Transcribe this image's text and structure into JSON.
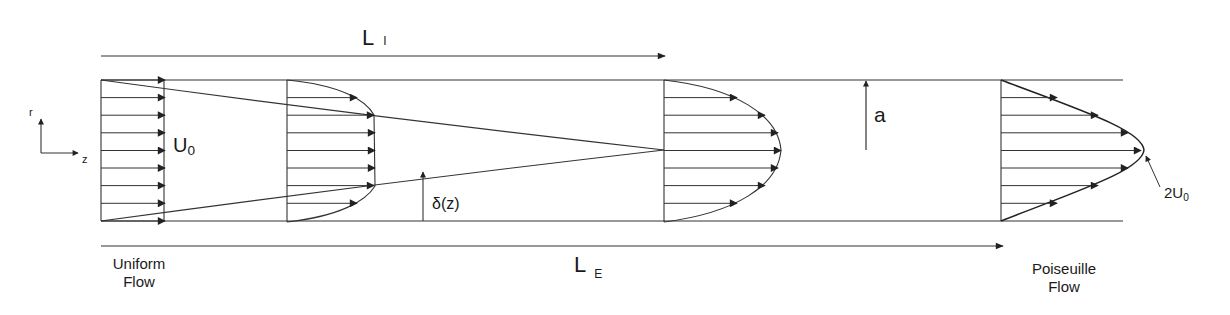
{
  "diagram": {
    "colors": {
      "line": "#333333",
      "text": "#1a1a1a",
      "background": "#ffffff"
    },
    "axes": {
      "r_label": "r",
      "z_label": "z"
    },
    "dimensions": {
      "inlet_length": {
        "symbol": "L",
        "subscript": "I"
      },
      "entrance_length": {
        "symbol": "L",
        "subscript": "E"
      },
      "radius": {
        "symbol": "a"
      },
      "boundary_layer": {
        "symbol": "δ(z)"
      }
    },
    "velocity_labels": {
      "uniform_velocity": {
        "symbol": "U",
        "subscript": "0"
      },
      "max_velocity": {
        "prefix": "2U",
        "subscript": "0"
      }
    },
    "captions": {
      "inlet_line1": "Uniform",
      "inlet_line2": "Flow",
      "outlet_line1": "Poiseuille",
      "outlet_line2": "Flow"
    },
    "profiles": [
      {
        "name": "uniform",
        "x": 101,
        "shape": "flat"
      },
      {
        "name": "developing-early",
        "x": 287,
        "shape": "blunt"
      },
      {
        "name": "developing-late",
        "x": 664,
        "shape": "rounded"
      },
      {
        "name": "poiseuille",
        "x": 1000,
        "shape": "parabolic"
      }
    ]
  }
}
